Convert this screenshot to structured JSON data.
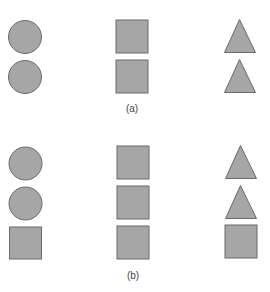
{
  "style": {
    "fill": "#a6a6a6",
    "stroke": "#6b6b6b",
    "background": "#ffffff",
    "label_color": "#444444"
  },
  "panels": [
    {
      "label": "(a)",
      "rows": [
        [
          "circle",
          "square",
          "triangle"
        ],
        [
          "circle",
          "square",
          "triangle"
        ]
      ]
    },
    {
      "label": "(b)",
      "rows": [
        [
          "circle",
          "square",
          "triangle"
        ],
        [
          "circle",
          "square",
          "triangle"
        ],
        [
          "square",
          "square",
          "square"
        ]
      ]
    }
  ]
}
